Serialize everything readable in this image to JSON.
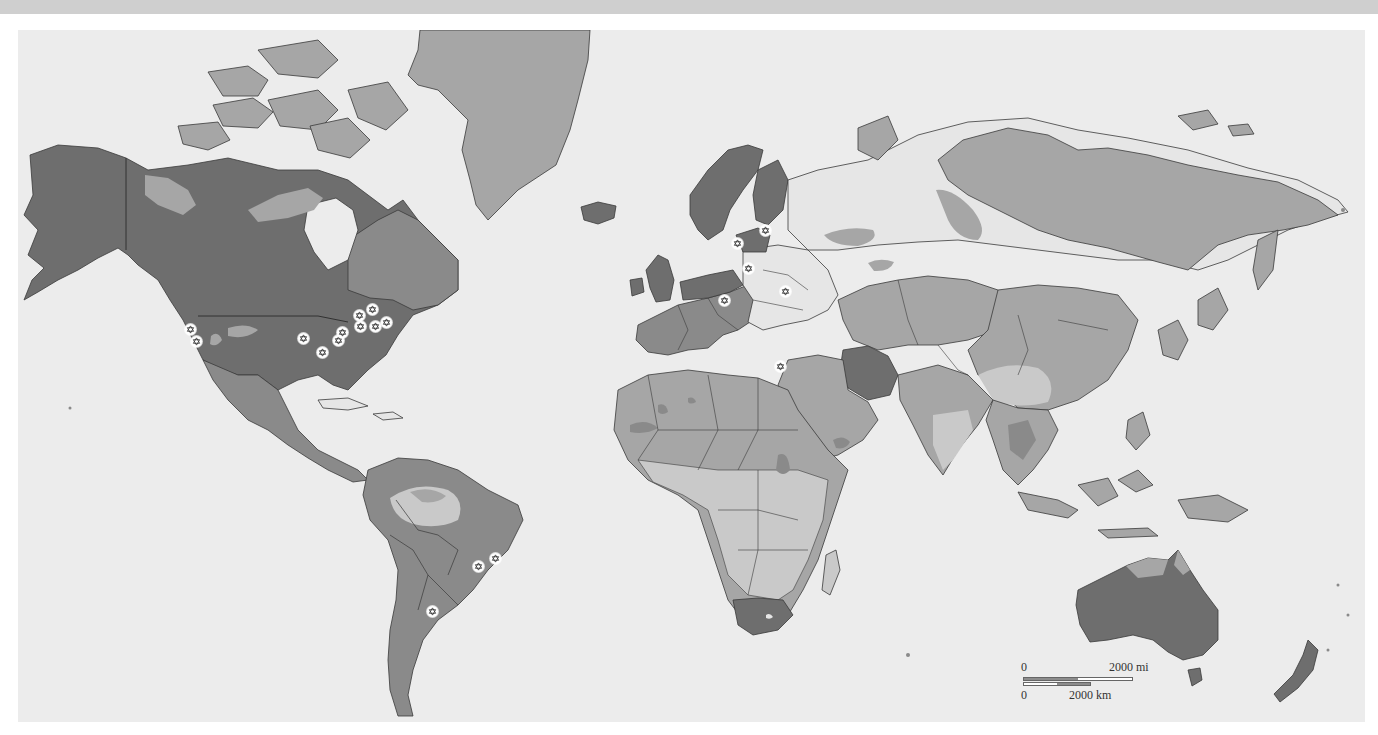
{
  "map": {
    "type": "world-choropleth",
    "projection": "mercator",
    "palette": {
      "ocean": "#ececec",
      "no_data": "#e6e6e6",
      "level_1_darkest": "#6e6e6e",
      "level_2": "#8a8a8a",
      "level_3": "#a6a6a6",
      "level_4_lightest": "#c9c9c9",
      "border": "#3a3a3a",
      "marker_fill": "#ffffff",
      "marker_symbol": "#333333"
    },
    "scale_bar": {
      "mi_zero": "0",
      "mi_label": "2000 mi",
      "km_zero": "0",
      "km_label": "2000 km"
    },
    "marker_symbol": "star-of-david-icon",
    "markers": [
      {
        "region": "US West Coast (north)",
        "x": 172,
        "y": 299
      },
      {
        "region": "US West Coast (south)",
        "x": 178,
        "y": 311
      },
      {
        "region": "US Midwest 1",
        "x": 304,
        "y": 322
      },
      {
        "region": "US Great Lakes 1",
        "x": 320,
        "y": 310
      },
      {
        "region": "US Great Lakes 2",
        "x": 324,
        "y": 302
      },
      {
        "region": "Ontario",
        "x": 341,
        "y": 285
      },
      {
        "region": "Quebec",
        "x": 354,
        "y": 279
      },
      {
        "region": "US Northeast 1",
        "x": 342,
        "y": 296
      },
      {
        "region": "US Northeast 2",
        "x": 357,
        "y": 296
      },
      {
        "region": "US Northeast 3",
        "x": 368,
        "y": 292
      },
      {
        "region": "US Midwest 2",
        "x": 285,
        "y": 308
      },
      {
        "region": "Brazil (Rio)",
        "x": 460,
        "y": 536
      },
      {
        "region": "Brazil (NE)",
        "x": 477,
        "y": 528
      },
      {
        "region": "Argentina",
        "x": 414,
        "y": 581
      },
      {
        "region": "Lithuania",
        "x": 719,
        "y": 213
      },
      {
        "region": "Latvia",
        "x": 747,
        "y": 200
      },
      {
        "region": "Belarus",
        "x": 730,
        "y": 238
      },
      {
        "region": "Ukraine",
        "x": 767,
        "y": 261
      },
      {
        "region": "Hungary",
        "x": 706,
        "y": 270
      },
      {
        "region": "Israel",
        "x": 762,
        "y": 336
      }
    ]
  }
}
